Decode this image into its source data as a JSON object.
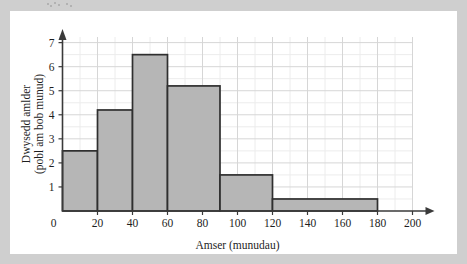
{
  "figure": {
    "background_color": "#cfcfcf",
    "panel_color": "#ffffff"
  },
  "chart_data": {
    "type": "bar",
    "title": "",
    "subtitle": "",
    "xlabel": "Amser (munudau)",
    "ylabel_line1": "Dwysedd amlder",
    "ylabel_line2": "(pobl am bob munud)",
    "ylabel": "Dwysedd amlder (pobl am bob munud)",
    "xlim": [
      0,
      200
    ],
    "ylim": [
      0,
      7.4
    ],
    "grid": true,
    "legend": "none",
    "bar_fill_color": "#b6b6b6",
    "bar_edge_color": "#2f2f2f",
    "grid_major_color": "#d6d6d6",
    "grid_minor_color": "#ececec",
    "axis_color": "#3a3a3a",
    "x_ticks": [
      0,
      20,
      40,
      60,
      80,
      100,
      120,
      140,
      160,
      180,
      200
    ],
    "x_tick_labels": [
      "0",
      "20",
      "40",
      "60",
      "80",
      "100",
      "120",
      "140",
      "160",
      "180",
      "200"
    ],
    "y_ticks": [
      0,
      1,
      2,
      3,
      4,
      5,
      6,
      7
    ],
    "y_tick_labels": [
      "0",
      "1",
      "2",
      "3",
      "4",
      "5",
      "6",
      "7"
    ],
    "categories": [
      "0-20",
      "20-40",
      "40-60",
      "60-90",
      "90-120",
      "120-180"
    ],
    "values": [
      2.5,
      4.2,
      6.5,
      5.2,
      1.5,
      0.5
    ],
    "bins": [
      {
        "label": "0-20",
        "start": 0,
        "end": 20,
        "density": 2.5,
        "frequency": 50
      },
      {
        "label": "20-40",
        "start": 20,
        "end": 40,
        "density": 4.2,
        "frequency": 84
      },
      {
        "label": "40-60",
        "start": 40,
        "end": 60,
        "density": 6.5,
        "frequency": 130
      },
      {
        "label": "60-90",
        "start": 60,
        "end": 90,
        "density": 5.2,
        "frequency": 156
      },
      {
        "label": "90-120",
        "start": 90,
        "end": 120,
        "density": 1.5,
        "frequency": 45
      },
      {
        "label": "120-180",
        "start": 120,
        "end": 180,
        "density": 0.5,
        "frequency": 30
      }
    ]
  }
}
